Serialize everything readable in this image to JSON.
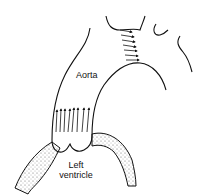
{
  "diagram": {
    "labels": {
      "aorta": "Aorta",
      "ventricle_line1": "Left",
      "ventricle_line2": "ventricle"
    },
    "colors": {
      "ink": "#111111",
      "stipple": "#555555",
      "background": "#ffffff"
    },
    "arrows": {
      "base_count": 8,
      "arch_count": 7
    }
  }
}
